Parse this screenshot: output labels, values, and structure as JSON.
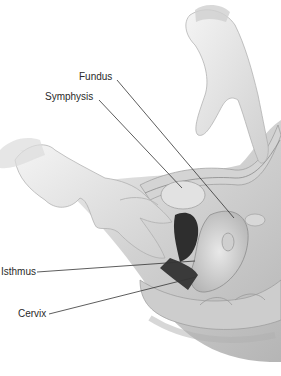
{
  "figure": {
    "labels": [
      {
        "id": "fundus",
        "text": "Fundus",
        "x": 79,
        "y": 71
      },
      {
        "id": "symphysis",
        "text": "Symphysis",
        "x": 45,
        "y": 91
      },
      {
        "id": "isthmus",
        "text": "Isthmus",
        "x": 1,
        "y": 268
      },
      {
        "id": "cervix",
        "text": "Cervix",
        "x": 18,
        "y": 310
      }
    ],
    "leaders": [
      {
        "id": "fundus",
        "from": [
          117,
          80
        ],
        "to": [
          234,
          218
        ]
      },
      {
        "id": "symphysis",
        "from": [
          99,
          100
        ],
        "to": [
          182,
          188
        ]
      },
      {
        "id": "isthmus",
        "from": [
          37,
          272
        ],
        "to": [
          195,
          261
        ]
      },
      {
        "id": "cervix",
        "from": [
          49,
          314
        ],
        "to": [
          196,
          277
        ]
      }
    ],
    "colors": {
      "background": "#ffffff",
      "skin": "#d9d9d9",
      "glove": "#e6e6e6",
      "tissue": "#c8c8c8",
      "dark": "#3a3a3a",
      "leader": "#333333"
    }
  }
}
